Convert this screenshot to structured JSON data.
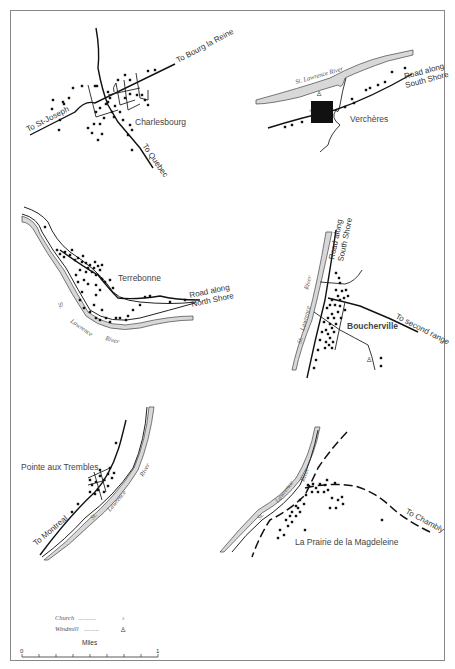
{
  "figure": {
    "colors": {
      "ink": "#111111",
      "water": "#d8d8d8",
      "border": "#888888",
      "background": "#ffffff"
    }
  },
  "maps": {
    "charlesbourg": {
      "town": "Charlesbourg",
      "roads": {
        "northeast": "To Bourg la Reine",
        "west": "To St-Joseph",
        "southeast": "To Quebec"
      }
    },
    "vercheres": {
      "town": "Verchères",
      "river": "St. Lawrence River",
      "road": "Road along South Shore",
      "road_line1": "Road along",
      "road_line2": "South Shore"
    },
    "terrebonne": {
      "town": "Terrebonne",
      "river_words": [
        "St.",
        "Lawrence",
        "River"
      ],
      "road_line1": "Road along",
      "road_line2": "North Shore"
    },
    "boucherville": {
      "town": "Boucherville",
      "river_words": [
        "St.",
        "Lawrence",
        "River"
      ],
      "road_line1": "Road along",
      "road_line2": "South Shore",
      "second_range": "To second range"
    },
    "pointe_aux_trembles": {
      "town": "Pointe aux Trembles",
      "river_words": [
        "St.",
        "Lawrence",
        "River"
      ],
      "road": "To Montreal"
    },
    "la_prairie": {
      "town": "La Prairie de la Magdeleine",
      "river_words": [
        "St.",
        "Lawrence",
        "River"
      ],
      "road": "To Chambly"
    }
  },
  "legend": {
    "items": [
      {
        "label": "Church",
        "leader": "...........",
        "icon": "church-icon"
      },
      {
        "label": "Windmill",
        "leader": ".........",
        "icon": "windmill-icon"
      }
    ]
  },
  "scale": {
    "title": "Miles",
    "min_label": "0",
    "max_label": "1",
    "ticks": 8
  }
}
